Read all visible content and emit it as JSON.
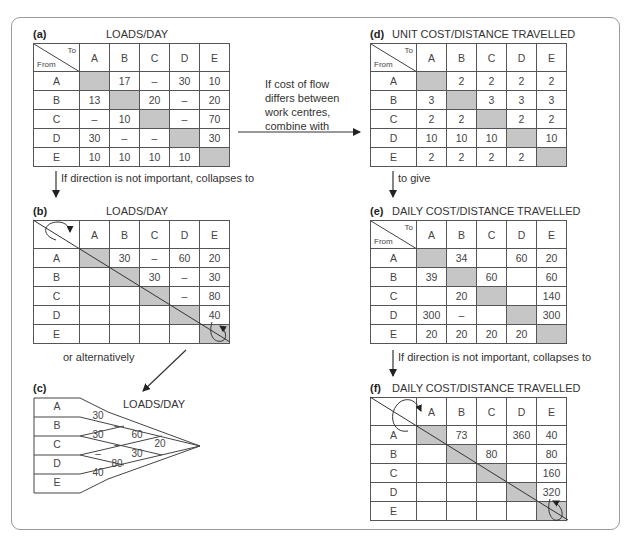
{
  "columns": [
    "A",
    "B",
    "C",
    "D",
    "E"
  ],
  "rows": [
    "A",
    "B",
    "C",
    "D",
    "E"
  ],
  "corner": {
    "to": "To",
    "from": "From"
  },
  "panels": {
    "a": {
      "label": "(a)",
      "title": "LOADS/DAY",
      "cells": [
        [
          "",
          "17",
          "–",
          "30",
          "10"
        ],
        [
          "13",
          "",
          "20",
          "–",
          "20"
        ],
        [
          "–",
          "10",
          "",
          "–",
          "70"
        ],
        [
          "30",
          "–",
          "–",
          "",
          "30"
        ],
        [
          "10",
          "10",
          "10",
          "10",
          ""
        ]
      ]
    },
    "b": {
      "label": "(b)",
      "title": "LOADS/DAY",
      "cells": [
        [
          "",
          "30",
          "–",
          "60",
          "20"
        ],
        [
          "",
          "",
          "30",
          "–",
          "30"
        ],
        [
          "",
          "",
          "",
          "–",
          "80"
        ],
        [
          "",
          "",
          "",
          "",
          "40"
        ],
        [
          "",
          "",
          "",
          "",
          ""
        ]
      ]
    },
    "c": {
      "label": "(c)",
      "title": "LOADS/DAY",
      "rows": [
        "A",
        "B",
        "C",
        "D",
        "E"
      ],
      "values": {
        "AB": "30",
        "BC": "30",
        "CD": "–",
        "DE": "40",
        "AC": "–",
        "BD": "–",
        "CE": "80",
        "AD": "60",
        "BE": "30",
        "AE": "20"
      }
    },
    "d": {
      "label": "(d)",
      "title": "UNIT COST/DISTANCE TRAVELLED",
      "cells": [
        [
          "",
          "2",
          "2",
          "2",
          "2"
        ],
        [
          "3",
          "",
          "3",
          "3",
          "3"
        ],
        [
          "2",
          "2",
          "",
          "2",
          "2"
        ],
        [
          "10",
          "10",
          "10",
          "",
          "10"
        ],
        [
          "2",
          "2",
          "2",
          "2",
          ""
        ]
      ]
    },
    "e": {
      "label": "(e)",
      "title": "DAILY COST/DISTANCE TRAVELLED",
      "cells": [
        [
          "",
          "34",
          "",
          "60",
          "20"
        ],
        [
          "39",
          "",
          "60",
          "",
          "60"
        ],
        [
          "",
          "20",
          "",
          "",
          "140"
        ],
        [
          "300",
          "–",
          "",
          "",
          "300"
        ],
        [
          "20",
          "20",
          "20",
          "20",
          ""
        ]
      ]
    },
    "f": {
      "label": "(f)",
      "title": "DAILY COST/DISTANCE TRAVELLED",
      "cells": [
        [
          "",
          "73",
          "",
          "360",
          "40"
        ],
        [
          "",
          "",
          "80",
          "",
          "80"
        ],
        [
          "",
          "",
          "",
          "",
          "160"
        ],
        [
          "",
          "",
          "",
          "",
          "320"
        ],
        [
          "",
          "",
          "",
          "",
          ""
        ]
      ]
    }
  },
  "annotations": {
    "a_to_b": "If direction is not important, collapses to",
    "a_to_d": [
      "If cost of flow",
      "differs between",
      "work centres,",
      "combine with"
    ],
    "d_to_e": "to give",
    "b_to_c": "or alternatively",
    "e_to_f": "If direction is not important, collapses to"
  },
  "colors": {
    "diagonal_fill": "#c6c6c6",
    "border": "#555555",
    "frame": "#9a9a9a"
  }
}
